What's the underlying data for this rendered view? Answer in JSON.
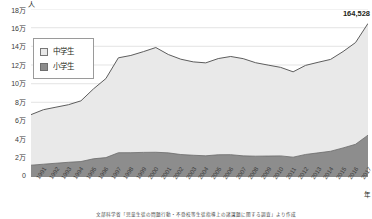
{
  "axes": {
    "y_unit": "人",
    "x_unit": "年",
    "y_ticks": [
      "18万",
      "16万",
      "14万",
      "12万",
      "10万",
      "8万",
      "6万",
      "4万",
      "2万",
      "0"
    ]
  },
  "legend": {
    "items": [
      {
        "label": "中学生",
        "color": "#e9e9e9"
      },
      {
        "label": "小学生",
        "color": "#8d8d8d"
      }
    ]
  },
  "callout": {
    "value": "164,528"
  },
  "source": {
    "text": "文部科学省「児童生徒の問題行動・不登校等生徒指導上の諸課題に関する調査」より作成"
  },
  "chart_data": {
    "type": "area",
    "title": "",
    "xlabel": "年",
    "ylabel": "人",
    "ylim": [
      0,
      180000
    ],
    "grid": true,
    "legend_position": "inside-top-left",
    "stacked": true,
    "annotations": [
      {
        "text": "164,528",
        "x": "2018",
        "series": "合計"
      }
    ],
    "categories": [
      "1991",
      "1992",
      "1993",
      "1994",
      "1995",
      "1996",
      "1997",
      "1998",
      "1999",
      "2000",
      "2001",
      "2002",
      "2003",
      "2004",
      "2005",
      "2006",
      "2007",
      "2008",
      "2009",
      "2010",
      "2011",
      "2012",
      "2013",
      "2014",
      "2015",
      "2016",
      "2017",
      "2018"
    ],
    "series": [
      {
        "name": "小学生",
        "values": [
          12645,
          13710,
          14769,
          15786,
          16569,
          19498,
          20765,
          26017,
          26047,
          26373,
          26511,
          25869,
          24077,
          23318,
          22709,
          23825,
          23927,
          22652,
          22327,
          22463,
          22622,
          21243,
          24175,
          25864,
          27583,
          31151,
          35032,
          44841
        ]
      },
      {
        "name": "中学生",
        "values": [
          54172,
          58421,
          60039,
          61663,
          65022,
          74853,
          84701,
          101675,
          104180,
          107913,
          112211,
          105383,
          102149,
          100040,
          99578,
          103069,
          105197,
          104153,
          100105,
          97428,
          94836,
          91446,
          95442,
          97033,
          98408,
          103235,
          108999,
          119687
        ]
      }
    ],
    "total_last": 164528
  }
}
